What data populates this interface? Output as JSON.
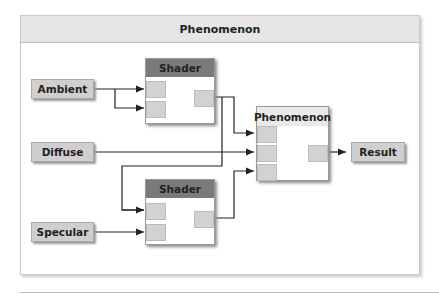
{
  "panel": {
    "title": "Phenomenon"
  },
  "inputs": [
    {
      "label": "Ambient"
    },
    {
      "label": "Diffuse"
    },
    {
      "label": "Specular"
    }
  ],
  "nodes": {
    "shader_top": {
      "title": "Shader"
    },
    "shader_bottom": {
      "title": "Shader"
    },
    "phenomenon": {
      "title": "Phenomenon"
    }
  },
  "output": {
    "label": "Result"
  },
  "colors": {
    "shader_header": "#7a7a7a",
    "phenomenon_header": "#e9e9e9",
    "port": "#d2d2d2",
    "wire": "#222222"
  }
}
